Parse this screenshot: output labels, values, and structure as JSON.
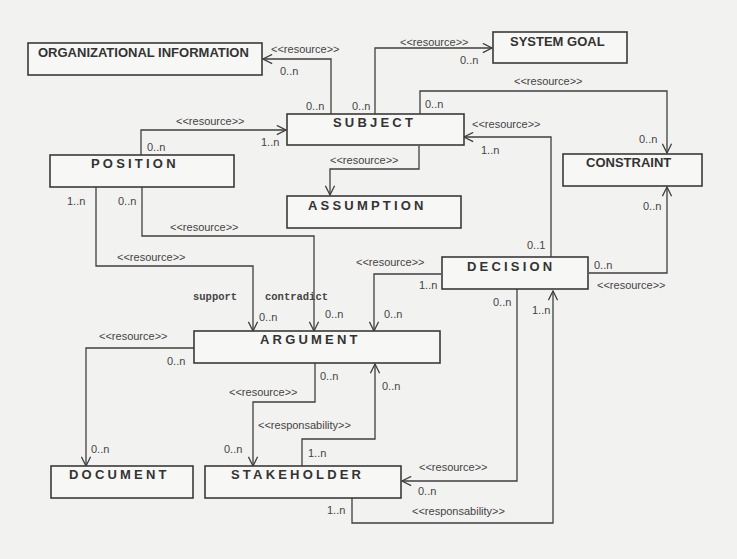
{
  "diagram": {
    "type": "uml-class-diagram",
    "entities": {
      "organizational_information": "ORGANIZATIONAL INFORMATION",
      "system_goal": "SYSTEM GOAL",
      "subject": "SUBJECT",
      "constraint": "CONSTRAINT",
      "position": "POSITION",
      "assumption": "ASSUMPTION",
      "decision": "DECISION",
      "argument": "ARGUMENT",
      "document": "DOCUMENT",
      "stakeholder": "STAKEHOLDER"
    },
    "stereotypes": {
      "resource": "<<resource>>",
      "responsability": "<<responsability>>"
    },
    "roles": {
      "support": "support",
      "contradict": "contradict"
    },
    "multiplicities": {
      "zero_n": "0..n",
      "one_n": "1..n",
      "zero_one": "0..1"
    },
    "relations": [
      {
        "from": "SUBJECT",
        "to": "ORGANIZATIONAL INFORMATION",
        "stereotype": "<<resource>>",
        "from_mult": "0..n",
        "to_mult": "0..n"
      },
      {
        "from": "SUBJECT",
        "to": "SYSTEM GOAL",
        "stereotype": "<<resource>>",
        "from_mult": "0..n",
        "to_mult": "0..n"
      },
      {
        "from": "SUBJECT",
        "to": "CONSTRAINT",
        "stereotype": "<<resource>>",
        "from_mult": "0..n",
        "to_mult": "0..n"
      },
      {
        "from": "POSITION",
        "to": "SUBJECT",
        "stereotype": "<<resource>>",
        "from_mult": "0..n",
        "to_mult": "1..n"
      },
      {
        "from": "SUBJECT",
        "to": "ASSUMPTION",
        "stereotype": "<<resource>>"
      },
      {
        "from": "DECISION",
        "to": "SUBJECT",
        "stereotype": "<<resource>>",
        "from_mult": "0..1",
        "to_mult": "1..n"
      },
      {
        "from": "DECISION",
        "to": "CONSTRAINT",
        "stereotype": "<<resource>>",
        "from_mult": "0..n",
        "to_mult": "0..n"
      },
      {
        "from": "POSITION",
        "to": "ARGUMENT",
        "stereotype": "<<resource>>",
        "role": "support",
        "from_mult": "1..n",
        "to_mult": "0..n"
      },
      {
        "from": "POSITION",
        "to": "ARGUMENT",
        "stereotype": "<<resource>>",
        "role": "contradict",
        "from_mult": "0..n",
        "to_mult": "0..n"
      },
      {
        "from": "DECISION",
        "to": "ARGUMENT",
        "stereotype": "<<resource>>",
        "from_mult": "1..n",
        "to_mult": "0..n"
      },
      {
        "from": "ARGUMENT",
        "to": "DOCUMENT",
        "stereotype": "<<resource>>",
        "from_mult": "0..n",
        "to_mult": "0..n"
      },
      {
        "from": "ARGUMENT",
        "to": "STAKEHOLDER",
        "stereotype": "<<resource>>",
        "from_mult": "0..n",
        "to_mult": "0..n"
      },
      {
        "from": "STAKEHOLDER",
        "to": "ARGUMENT",
        "stereotype": "<<responsability>>",
        "from_mult": "1..n",
        "to_mult": "0..n"
      },
      {
        "from": "DECISION",
        "to": "STAKEHOLDER",
        "stereotype": "<<resource>>",
        "from_mult": "0..n",
        "to_mult": "0..n"
      },
      {
        "from": "STAKEHOLDER",
        "to": "DECISION",
        "stereotype": "<<responsability>>",
        "from_mult": "1..n",
        "to_mult": "1..n"
      }
    ]
  }
}
